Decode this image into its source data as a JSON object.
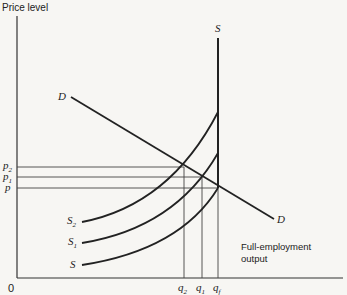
{
  "diagram": {
    "y_axis_label": "Price level",
    "origin_label": "0",
    "demand_label_start": "D",
    "demand_label_end": "D",
    "vertical_supply_label": "S",
    "supply_curves": [
      {
        "name": "S2",
        "base": "S",
        "sub": "2"
      },
      {
        "name": "S1",
        "base": "S",
        "sub": "1"
      },
      {
        "name": "S",
        "base": "S",
        "sub": ""
      }
    ],
    "price_levels": [
      {
        "base": "p",
        "sub": "2"
      },
      {
        "base": "p",
        "sub": "1"
      },
      {
        "base": "p",
        "sub": ""
      }
    ],
    "quantities": [
      {
        "base": "q",
        "sub": "2"
      },
      {
        "base": "q",
        "sub": "1"
      },
      {
        "base": "q",
        "sub": "f"
      }
    ],
    "annotation_line1": "Full-employment",
    "annotation_line2": "output",
    "line_color": "#222222"
  }
}
